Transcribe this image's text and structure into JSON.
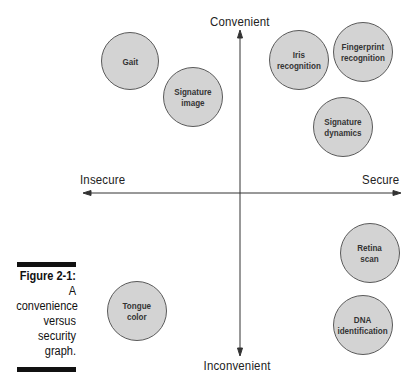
{
  "figure": {
    "caption_title": "Figure 2-1:",
    "caption_lines": [
      "A",
      "convenience",
      "versus",
      "security",
      "graph."
    ]
  },
  "axes": {
    "top_label": "Convenient",
    "bottom_label": "Inconvenient",
    "left_label": "Insecure",
    "right_label": "Secure"
  },
  "bubbles": [
    {
      "label": "Gait",
      "cx": 130,
      "cy": 61,
      "r": 29
    },
    {
      "label": "Signature\nimage",
      "cx": 193,
      "cy": 97,
      "r": 30
    },
    {
      "label": "Iris\nrecognition",
      "cx": 299,
      "cy": 60,
      "r": 30
    },
    {
      "label": "Fingerprint\nrecognition",
      "cx": 363,
      "cy": 52,
      "r": 30
    },
    {
      "label": "Signature\ndynamics",
      "cx": 343,
      "cy": 127,
      "r": 30
    },
    {
      "label": "Retina\nscan",
      "cx": 370,
      "cy": 253,
      "r": 30
    },
    {
      "label": "Tongue\ncolor",
      "cx": 137,
      "cy": 311,
      "r": 30
    },
    {
      "label": "DNA\nidentification",
      "cx": 363,
      "cy": 325,
      "r": 30
    }
  ],
  "colors": {
    "bubble_fill": "#d3d3d3",
    "bubble_border": "#5a5a5a",
    "axis": "#333333"
  }
}
